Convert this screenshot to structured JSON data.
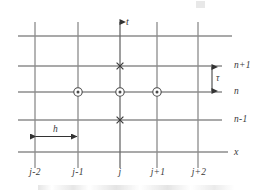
{
  "figure": {
    "axes": {
      "vertical_axis_label": "t",
      "horizontal_axis_label": "x"
    },
    "colors": {
      "grid_line": "#8c8c8c",
      "axis_line": "#4a4a4a",
      "marker_stroke": "#4a4a4a",
      "marker_fill": "#ffffff",
      "text": "#3a3a3a",
      "background": "#ffffff"
    },
    "columns": [
      {
        "label": "j-2",
        "x": 35
      },
      {
        "label": "j-1",
        "x": 78
      },
      {
        "label": "j",
        "x": 120
      },
      {
        "label": "j+1",
        "x": 157
      },
      {
        "label": "j+2",
        "x": 198
      }
    ],
    "rows": [
      {
        "label": "",
        "y": 36
      },
      {
        "label": "n+1",
        "y": 66
      },
      {
        "label": "n",
        "y": 92
      },
      {
        "label": "n-1",
        "y": 120
      },
      {
        "label": "x",
        "y": 152
      }
    ],
    "markers": [
      {
        "type": "circle",
        "column": "j-1",
        "row": "n",
        "x": 78,
        "y": 92
      },
      {
        "type": "circle",
        "column": "j",
        "row": "n",
        "x": 120,
        "y": 92
      },
      {
        "type": "circle",
        "column": "j+1",
        "row": "n",
        "x": 157,
        "y": 92
      },
      {
        "type": "cross",
        "column": "j",
        "row": "n+1",
        "x": 120,
        "y": 66
      },
      {
        "type": "cross",
        "column": "j",
        "row": "n-1",
        "x": 120,
        "y": 120
      }
    ],
    "measures": {
      "horizontal_spacing_label": "h",
      "vertical_spacing_label": "τ"
    }
  }
}
